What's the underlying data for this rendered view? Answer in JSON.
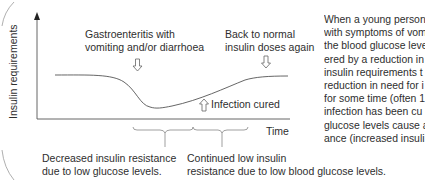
{
  "diagram": {
    "y_axis_label": "Insulin requirements",
    "x_axis_label": "Time",
    "annotations": {
      "gastro": [
        "Gastroenteritis with",
        "vomiting and/or diarrhoea"
      ],
      "back_to_normal": [
        "Back to normal",
        "insulin doses again"
      ],
      "infection_cured": "Infection cured"
    },
    "bottom_notes": {
      "decreased": [
        "Decreased insulin resistance",
        "due to low glucose levels."
      ],
      "continued": [
        "Continued low insulin",
        "resistance due to low blood glucose levels."
      ]
    },
    "colors": {
      "line": "#555555",
      "text": "#2e2e2e",
      "border": "#9a9a9a"
    }
  },
  "side_text": {
    "lines": [
      "When a young person",
      "with symptoms of vom",
      "the blood glucose leve",
      "ered by a reduction in",
      "insulin requirements t",
      "reduction in need for i",
      "for some time (often 1",
      "infection has been cu",
      "glucose levels cause a",
      "ance (increased insuli"
    ]
  }
}
